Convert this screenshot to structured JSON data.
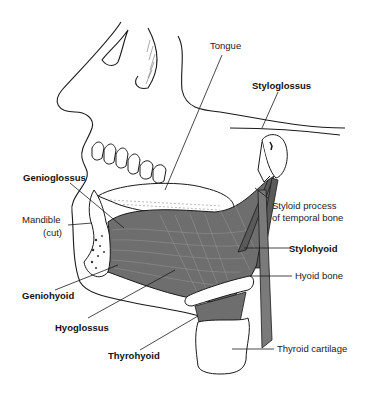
{
  "figure": {
    "labels": {
      "tongue": "Tongue",
      "styloglossus": "Styloglossus",
      "genioglossus": "Genioglossus",
      "mandible": "Mandible",
      "mandible_note": "(cut)",
      "styloid_line1": "Styloid process",
      "styloid_line2": "of temporal bone",
      "stylohyoid": "Stylohyoid",
      "hyoid_bone": "Hyoid bone",
      "geniohyoid": "Geniohyoid",
      "hyoglossus": "Hyoglossus",
      "thyrohyoid": "Thyrohyoid",
      "thyroid_cartilage": "Thyroid cartilage"
    },
    "colors": {
      "line": "#1a1a1a",
      "muscle": "#6e6e6e",
      "muscle_dark": "#4a4a4a",
      "bone": "#ffffff",
      "background": "#ffffff"
    }
  }
}
